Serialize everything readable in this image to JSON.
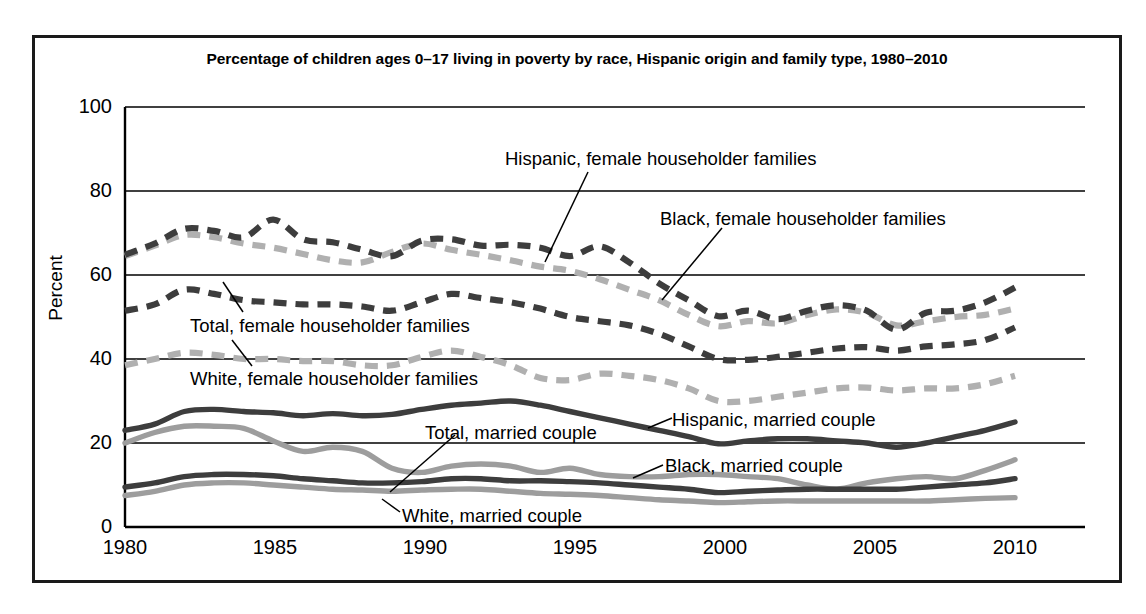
{
  "chart_data": {
    "type": "line",
    "title": "Percentage of children ages 0–17 living in poverty by race, Hispanic origin and family type, 1980–2010",
    "xlabel": "",
    "ylabel": "Percent",
    "ylim": [
      0,
      100
    ],
    "xlim": [
      1980,
      2010
    ],
    "yticks": [
      "0",
      "20",
      "40",
      "60",
      "80",
      "100"
    ],
    "xticks": [
      "1980",
      "1985",
      "1990",
      "1995",
      "2000",
      "2005",
      "2010"
    ],
    "grid": "horizontal",
    "legend_position": "inline-annotations",
    "x": [
      1980,
      1981,
      1982,
      1983,
      1984,
      1985,
      1986,
      1987,
      1988,
      1989,
      1990,
      1991,
      1992,
      1993,
      1994,
      1995,
      1996,
      1997,
      1998,
      1999,
      2000,
      2001,
      2002,
      2003,
      2004,
      2005,
      2006,
      2007,
      2008,
      2009,
      2010
    ],
    "series": [
      {
        "name": "Black, female householder families",
        "style": "dashed",
        "color": "#3d3d3d",
        "values": [
          64.8,
          67.5,
          71.0,
          70.5,
          69.0,
          73.2,
          68.5,
          67.8,
          66.0,
          64.5,
          68.2,
          68.5,
          67.0,
          67.2,
          66.5,
          64.5,
          66.8,
          63.0,
          58.0,
          54.0,
          50.2,
          51.5,
          49.5,
          51.5,
          52.8,
          51.5,
          47.0,
          51.0,
          51.5,
          53.5,
          57.0
        ]
      },
      {
        "name": "Hispanic, female householder families",
        "style": "dashed",
        "color": "#b0b0b0",
        "values": [
          64.5,
          67.0,
          69.5,
          69.0,
          67.5,
          66.5,
          65.0,
          63.5,
          63.0,
          65.5,
          67.5,
          66.0,
          64.8,
          63.5,
          62.0,
          61.0,
          59.0,
          56.5,
          54.0,
          50.5,
          47.8,
          49.0,
          48.5,
          50.5,
          51.8,
          51.0,
          48.0,
          49.0,
          50.0,
          50.5,
          52.0
        ]
      },
      {
        "name": "Total, female householder families",
        "style": "dashed",
        "color": "#3d3d3d",
        "values": [
          51.5,
          53.0,
          56.5,
          55.5,
          54.0,
          53.5,
          53.0,
          53.0,
          52.5,
          51.5,
          53.5,
          55.5,
          54.5,
          53.5,
          52.0,
          50.0,
          49.0,
          48.0,
          46.0,
          43.0,
          40.0,
          39.8,
          40.5,
          41.5,
          42.5,
          42.8,
          42.0,
          43.0,
          43.5,
          44.5,
          47.5
        ]
      },
      {
        "name": "White, female householder families",
        "style": "dashed",
        "color": "#b0b0b0",
        "values": [
          38.5,
          40.0,
          41.5,
          41.0,
          40.0,
          40.0,
          39.5,
          39.5,
          38.5,
          38.5,
          40.5,
          42.0,
          40.5,
          38.5,
          35.5,
          35.0,
          36.5,
          36.0,
          35.0,
          33.0,
          30.0,
          30.0,
          31.0,
          32.0,
          33.0,
          33.2,
          32.5,
          33.0,
          33.0,
          34.0,
          36.0
        ]
      },
      {
        "name": "Hispanic, married couple",
        "style": "solid",
        "color": "#3d3d3d",
        "values": [
          23.0,
          24.5,
          27.5,
          28.0,
          27.5,
          27.2,
          26.5,
          27.0,
          26.5,
          26.8,
          28.0,
          29.0,
          29.5,
          30.0,
          29.0,
          27.5,
          26.0,
          24.5,
          23.0,
          21.5,
          19.8,
          20.5,
          21.0,
          21.0,
          20.5,
          20.0,
          19.0,
          20.0,
          21.5,
          23.0,
          25.0
        ]
      },
      {
        "name": "Black, married couple",
        "style": "solid",
        "color": "#9d9d9d",
        "values": [
          20.0,
          22.5,
          24.0,
          24.0,
          23.5,
          20.5,
          18.0,
          19.0,
          18.0,
          14.0,
          13.0,
          14.5,
          15.0,
          14.5,
          13.0,
          14.0,
          12.5,
          12.0,
          12.0,
          12.5,
          12.5,
          12.0,
          11.5,
          10.0,
          9.0,
          10.5,
          11.5,
          12.0,
          11.5,
          13.5,
          16.0
        ]
      },
      {
        "name": "Total, married couple",
        "style": "solid",
        "color": "#3d3d3d",
        "values": [
          9.5,
          10.5,
          12.0,
          12.5,
          12.5,
          12.2,
          11.5,
          11.0,
          10.5,
          10.5,
          10.8,
          11.5,
          11.5,
          11.0,
          11.0,
          10.8,
          10.5,
          10.0,
          9.5,
          9.0,
          8.2,
          8.5,
          8.8,
          9.0,
          9.0,
          9.0,
          9.0,
          9.5,
          10.0,
          10.5,
          11.5
        ]
      },
      {
        "name": "White, married couple",
        "style": "solid",
        "color": "#9d9d9d",
        "values": [
          7.5,
          8.5,
          10.0,
          10.5,
          10.5,
          10.0,
          9.5,
          9.0,
          8.8,
          8.5,
          8.8,
          9.0,
          9.0,
          8.5,
          8.0,
          7.8,
          7.5,
          7.0,
          6.5,
          6.2,
          5.8,
          6.0,
          6.2,
          6.2,
          6.2,
          6.2,
          6.2,
          6.2,
          6.5,
          6.8,
          7.0
        ]
      }
    ],
    "annotations": [
      {
        "id": "hispanic-female-householder-families",
        "label": "Hispanic, female householder families"
      },
      {
        "id": "black-female-householder-families",
        "label": "Black, female householder families"
      },
      {
        "id": "total-female-householder-families",
        "label": "Total, female householder families"
      },
      {
        "id": "white-female-householder-families",
        "label": "White, female householder families"
      },
      {
        "id": "hispanic-married-couple",
        "label": "Hispanic, married couple"
      },
      {
        "id": "black-married-couple",
        "label": "Black, married couple"
      },
      {
        "id": "total-married-couple",
        "label": "Total, married couple"
      },
      {
        "id": "white-married-couple",
        "label": "White, married couple"
      }
    ],
    "colors": {
      "dark": "#3d3d3d",
      "light_dashed": "#b0b0b0",
      "light_solid": "#9d9d9d",
      "axis": "#000000",
      "frame": "#1a1a1a",
      "background": "#ffffff"
    }
  },
  "ylabels": {
    "t0": "0",
    "t20": "20",
    "t40": "40",
    "t60": "60",
    "t80": "80",
    "t100": "100",
    "axis_title": "Percent"
  },
  "xlabels": {
    "t1980": "1980",
    "t1985": "1985",
    "t1990": "1990",
    "t1995": "1995",
    "t2000": "2000",
    "t2005": "2005",
    "t2010": "2010"
  },
  "annot_text": {
    "hispanic_fh": "Hispanic, female householder families",
    "black_fh": "Black, female householder families",
    "total_fh": "Total, female householder families",
    "white_fh": "White, female householder families",
    "hispanic_mc": "Hispanic, married couple",
    "black_mc": "Black, married couple",
    "total_mc": "Total, married couple",
    "white_mc": "White, married couple"
  }
}
